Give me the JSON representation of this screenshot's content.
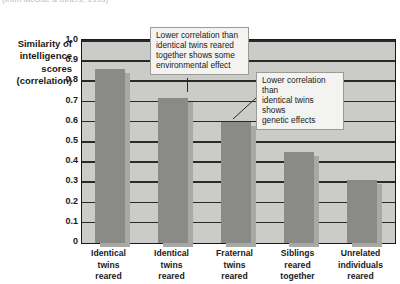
{
  "source_credit": "(from McGue & others, 1993)",
  "y_axis_title_lines": [
    "Similarity of",
    "intelligence",
    "scores",
    "(correlation)"
  ],
  "annotations": [
    {
      "id": "environmental",
      "lines": [
        "Lower correlation than",
        "identical twins reared",
        "together shows some",
        "environmental effect"
      ]
    },
    {
      "id": "genetic",
      "lines": [
        "Lower correlation than",
        "identical twins shows",
        "genetic effects"
      ]
    }
  ],
  "chart_data": {
    "type": "bar",
    "title": "",
    "xlabel": "",
    "ylabel": "Similarity of intelligence scores (correlation)",
    "ylim": [
      0,
      1.0
    ],
    "ytick_labels": [
      "1.0",
      "0.9",
      "0.8",
      "0.7",
      "0.6",
      "0.5",
      "0.4",
      "0.3",
      "0.2",
      "0.1",
      "0"
    ],
    "ytick_values": [
      1.0,
      0.9,
      0.8,
      0.7,
      0.6,
      0.5,
      0.4,
      0.3,
      0.2,
      0.1,
      0
    ],
    "grid": true,
    "legend": "none",
    "categories": [
      "Identical twins reared",
      "Identical twins reared",
      "Fraternal twins reared",
      "Siblings reared together",
      "Unrelated individuals reared"
    ],
    "category_label_lines": [
      [
        "Identical",
        "twins",
        "reared"
      ],
      [
        "Identical",
        "twins",
        "reared"
      ],
      [
        "Fraternal",
        "twins",
        "reared"
      ],
      [
        "Siblings",
        "reared",
        "together"
      ],
      [
        "Unrelated",
        "individuals",
        "reared"
      ]
    ],
    "values": [
      0.86,
      0.72,
      0.6,
      0.45,
      0.31
    ],
    "bar_color": "#8a8a87",
    "bar_shadow_color": "#a8a8a4",
    "plot_background": "#cbcbc8",
    "gridline_color": "#2a2a2a"
  }
}
